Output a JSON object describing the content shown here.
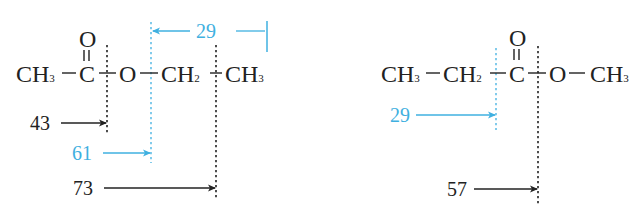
{
  "colors": {
    "text": "#222222",
    "highlight": "#3fb0e0",
    "background": "#ffffff"
  },
  "left_molecule": {
    "name": "ethyl acetate",
    "groups": {
      "g1": "CH",
      "g1_sub": "3",
      "carbonyl_c": "C",
      "carbonyl_o": "O",
      "ester_o": "O",
      "g2": "CH",
      "g2_sub": "2",
      "g3": "CH",
      "g3_sub": "3"
    },
    "fragments": [
      {
        "mz": "43",
        "color": "dark",
        "cleavage": "between C=O and O"
      },
      {
        "mz": "61",
        "color": "cyan",
        "cleavage": "between O and CH2"
      },
      {
        "mz": "73",
        "color": "dark",
        "cleavage": "between CH2 and CH3"
      },
      {
        "mz": "29",
        "color": "cyan",
        "cleavage": "ethyl fragment, right of O"
      }
    ]
  },
  "right_molecule": {
    "name": "methyl propanoate",
    "groups": {
      "g1": "CH",
      "g1_sub": "3",
      "g2": "CH",
      "g2_sub": "2",
      "carbonyl_c": "C",
      "carbonyl_o": "O",
      "ester_o": "O",
      "g3": "CH",
      "g3_sub": "3"
    },
    "fragments": [
      {
        "mz": "29",
        "color": "cyan",
        "cleavage": "between CH2 and C=O"
      },
      {
        "mz": "57",
        "color": "dark",
        "cleavage": "between C=O and O"
      }
    ]
  }
}
